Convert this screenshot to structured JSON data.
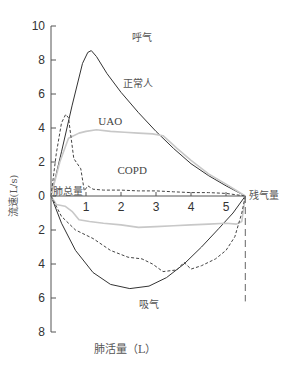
{
  "chart_data": {
    "type": "line",
    "title": "",
    "xlabel": "肺活量（L）",
    "ylabel": "流速(L/s)",
    "xlim": [
      0,
      5.55
    ],
    "ylim": [
      -8,
      10
    ],
    "grid": false,
    "x_ticks": [
      1,
      2,
      3,
      4,
      5
    ],
    "y_ticks": [
      {
        "value": 10,
        "label": "10"
      },
      {
        "value": 8,
        "label": "8"
      },
      {
        "value": 6,
        "label": "6"
      },
      {
        "value": 4,
        "label": "4"
      },
      {
        "value": 2,
        "label": "2"
      },
      {
        "value": 0,
        "label": "0"
      },
      {
        "value": -2,
        "label": "2"
      },
      {
        "value": -4,
        "label": "4"
      },
      {
        "value": -6,
        "label": "6"
      },
      {
        "value": -8,
        "label": "8"
      }
    ],
    "annotations": [
      {
        "text": "呼气",
        "x": 2.3,
        "y": 9.1
      },
      {
        "text": "正常人",
        "x": 2.05,
        "y": 6.4
      },
      {
        "text": "UAO",
        "x": 1.35,
        "y": 4.2
      },
      {
        "text": "COPD",
        "x": 1.9,
        "y": 1.3
      },
      {
        "text": "肺总量",
        "x": 0.05,
        "y": 0.05
      },
      {
        "text": "残气量",
        "x": 5.65,
        "y": -0.2
      },
      {
        "text": "吸气",
        "x": 2.5,
        "y": -6.6
      }
    ],
    "series": [
      {
        "name": "正常人 (expiration)",
        "style": "solid",
        "color": "#333333",
        "points": [
          [
            0,
            0
          ],
          [
            0.3,
            2.6
          ],
          [
            0.6,
            5.3
          ],
          [
            0.9,
            7.8
          ],
          [
            1.05,
            8.45
          ],
          [
            1.15,
            8.55
          ],
          [
            1.3,
            8.2
          ],
          [
            1.6,
            7.2
          ],
          [
            2.0,
            6.1
          ],
          [
            2.5,
            4.9
          ],
          [
            3.0,
            3.8
          ],
          [
            3.5,
            2.8
          ],
          [
            4.0,
            1.9
          ],
          [
            4.5,
            1.2
          ],
          [
            5.0,
            0.6
          ],
          [
            5.55,
            0
          ]
        ]
      },
      {
        "name": "正常人 (inspiration)",
        "style": "solid",
        "color": "#333333",
        "points": [
          [
            0,
            0
          ],
          [
            0.3,
            -1.6
          ],
          [
            0.7,
            -3.2
          ],
          [
            1.2,
            -4.5
          ],
          [
            1.7,
            -5.2
          ],
          [
            2.25,
            -5.45
          ],
          [
            2.8,
            -5.3
          ],
          [
            3.3,
            -4.8
          ],
          [
            3.8,
            -4.0
          ],
          [
            4.3,
            -3.0
          ],
          [
            4.8,
            -1.9
          ],
          [
            5.2,
            -1.0
          ],
          [
            5.55,
            0
          ]
        ]
      },
      {
        "name": "UAO (expiration)",
        "style": "solid",
        "color": "#c8c8c8",
        "points": [
          [
            0,
            0
          ],
          [
            0.25,
            2.0
          ],
          [
            0.5,
            3.4
          ],
          [
            0.6,
            3.5
          ],
          [
            0.8,
            3.7
          ],
          [
            1.0,
            3.8
          ],
          [
            1.3,
            3.9
          ],
          [
            1.7,
            3.8
          ],
          [
            2.1,
            3.75
          ],
          [
            2.5,
            3.7
          ],
          [
            2.9,
            3.65
          ],
          [
            3.2,
            3.55
          ],
          [
            3.6,
            2.8
          ],
          [
            4.0,
            2.1
          ],
          [
            4.5,
            1.3
          ],
          [
            5.0,
            0.7
          ],
          [
            5.55,
            0
          ]
        ]
      },
      {
        "name": "UAO (inspiration)",
        "style": "solid",
        "color": "#c8c8c8",
        "points": [
          [
            0,
            0
          ],
          [
            0.15,
            -0.5
          ],
          [
            0.4,
            -0.6
          ],
          [
            0.6,
            -0.9
          ],
          [
            0.8,
            -1.4
          ],
          [
            1.1,
            -1.5
          ],
          [
            1.5,
            -1.6
          ],
          [
            2.0,
            -1.7
          ],
          [
            2.5,
            -1.85
          ],
          [
            3.0,
            -1.8
          ],
          [
            3.5,
            -1.75
          ],
          [
            4.0,
            -1.7
          ],
          [
            4.5,
            -1.65
          ],
          [
            5.0,
            -1.6
          ],
          [
            5.3,
            -1.65
          ],
          [
            5.45,
            -1.5
          ],
          [
            5.55,
            0
          ]
        ]
      },
      {
        "name": "COPD (expiration)",
        "style": "dashed",
        "color": "#444444",
        "points": [
          [
            0,
            0
          ],
          [
            0.15,
            2.5
          ],
          [
            0.3,
            4.3
          ],
          [
            0.42,
            4.8
          ],
          [
            0.5,
            4.6
          ],
          [
            0.65,
            2.2
          ],
          [
            0.85,
            1.6
          ],
          [
            0.95,
            0.3
          ],
          [
            1.05,
            0.6
          ],
          [
            1.2,
            0.4
          ],
          [
            1.5,
            0.35
          ],
          [
            2.0,
            0.35
          ],
          [
            2.5,
            0.3
          ],
          [
            3.0,
            0.3
          ],
          [
            3.5,
            0.25
          ],
          [
            4.0,
            0.2
          ],
          [
            4.5,
            0.2
          ],
          [
            5.0,
            0.15
          ],
          [
            5.55,
            0
          ]
        ]
      },
      {
        "name": "COPD (inspiration)",
        "style": "dashed",
        "color": "#444444",
        "points": [
          [
            0,
            0
          ],
          [
            0.3,
            -1.2
          ],
          [
            0.7,
            -2.0
          ],
          [
            1.2,
            -2.5
          ],
          [
            1.7,
            -3.2
          ],
          [
            2.2,
            -3.6
          ],
          [
            2.6,
            -3.7
          ],
          [
            2.9,
            -4.0
          ],
          [
            3.2,
            -4.45
          ],
          [
            3.6,
            -4.35
          ],
          [
            3.8,
            -3.9
          ],
          [
            4.0,
            -4.3
          ],
          [
            4.3,
            -4.1
          ],
          [
            4.7,
            -3.7
          ],
          [
            5.0,
            -3.2
          ],
          [
            5.25,
            -2.4
          ],
          [
            5.45,
            -1.0
          ],
          [
            5.55,
            0
          ]
        ]
      },
      {
        "name": "残气量 reference",
        "style": "long-dashed",
        "color": "#666666",
        "points": [
          [
            5.55,
            0
          ],
          [
            5.55,
            -6.2
          ]
        ]
      }
    ]
  }
}
